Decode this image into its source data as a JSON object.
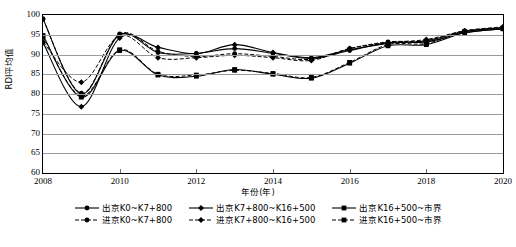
{
  "chart_data": {
    "type": "line",
    "title": "",
    "xlabel": "年份(年)",
    "ylabel": "RDI平均值",
    "xlim": [
      2008,
      2020
    ],
    "ylim": [
      60,
      100
    ],
    "grid": true,
    "legend_position": "bottom",
    "x": [
      2008,
      2009,
      2010,
      2011,
      2012,
      2013,
      2014,
      2015,
      2016,
      2017,
      2018,
      2019,
      2020
    ],
    "xticks": [
      "2008",
      "2010",
      "2012",
      "2014",
      "2016",
      "2018",
      "2020"
    ],
    "yticks": [
      "60",
      "65",
      "70",
      "75",
      "80",
      "85",
      "90",
      "95",
      "100"
    ],
    "series": [
      {
        "name": "出京K0~K7+800",
        "style": "solid",
        "marker": "circle",
        "values": [
          99.0,
          80.0,
          95.0,
          90.5,
          90.3,
          91.5,
          90.3,
          89.0,
          91.0,
          93.0,
          93.2,
          95.5,
          96.5
        ]
      },
      {
        "name": "出京K7+800~K16+500",
        "style": "solid",
        "marker": "diamond",
        "values": [
          93.0,
          76.8,
          94.2,
          91.8,
          90.2,
          92.5,
          90.5,
          89.2,
          91.2,
          92.8,
          93.5,
          95.8,
          96.8
        ]
      },
      {
        "name": "出京K16+500~市界",
        "style": "solid",
        "marker": "square",
        "values": [
          94.8,
          79.2,
          91.0,
          84.8,
          84.5,
          86.2,
          85.0,
          84.0,
          87.8,
          92.2,
          92.5,
          95.5,
          96.5
        ]
      },
      {
        "name": "进京K0~K7+800",
        "style": "dashed",
        "marker": "circle",
        "values": [
          99.0,
          80.2,
          95.2,
          90.8,
          89.5,
          90.2,
          89.5,
          88.8,
          91.5,
          93.2,
          93.5,
          96.0,
          96.8
        ]
      },
      {
        "name": "进京K7+800~K16+500",
        "style": "dashed",
        "marker": "diamond",
        "values": [
          93.2,
          83.0,
          94.8,
          89.2,
          89.2,
          89.8,
          89.2,
          88.5,
          91.5,
          93.0,
          93.8,
          96.0,
          97.0
        ]
      },
      {
        "name": "进京K16+500~市界",
        "style": "dashed",
        "marker": "square",
        "values": [
          94.5,
          79.5,
          91.2,
          85.0,
          84.8,
          86.0,
          85.2,
          84.2,
          88.0,
          92.5,
          92.8,
          95.8,
          96.6
        ]
      }
    ]
  },
  "axis": {
    "y_title": "RDI平均值",
    "x_title": "年份(年)",
    "yticks": [
      "100",
      "95",
      "90",
      "85",
      "80",
      "75",
      "70",
      "65",
      "60"
    ],
    "xticks": [
      "2008",
      "2010",
      "2012",
      "2014",
      "2016",
      "2018",
      "2020"
    ]
  },
  "legend": {
    "rows": [
      [
        {
          "label": "出京K0~K7+800",
          "style": "solid",
          "marker": "circle"
        },
        {
          "label": "出京K7+800~K16+500",
          "style": "solid",
          "marker": "diamond"
        },
        {
          "label": "出京K16+500~市界",
          "style": "solid",
          "marker": "square"
        }
      ],
      [
        {
          "label": "进京K0~K7+800",
          "style": "dashed",
          "marker": "circle"
        },
        {
          "label": "进京K7+800~K16+500",
          "style": "dashed",
          "marker": "diamond"
        },
        {
          "label": "进京K16+500~市界",
          "style": "dashed",
          "marker": "square"
        }
      ]
    ]
  },
  "colors": {
    "series": "#000000",
    "grid": "#9a9a9a",
    "frame": "#000000",
    "background": "#ffffff"
  }
}
